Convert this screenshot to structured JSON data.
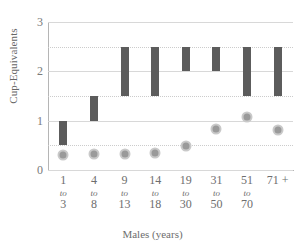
{
  "chart_data": {
    "type": "bar",
    "title": "",
    "subtitle": "",
    "xlabel": "Males (years)",
    "ylabel": "Cup-Equivalents",
    "ylim": [
      0,
      3
    ],
    "yticks": [
      0,
      1,
      2,
      3
    ],
    "minor_gridlines": [
      0.5,
      1.5,
      2.5
    ],
    "grid": true,
    "legend": "none",
    "categories": [
      "1 to 3",
      "4 to 8",
      "9 to 13",
      "14 to 18",
      "19 to 30",
      "31 to 50",
      "51 to 70",
      "71 +"
    ],
    "category_parts": [
      {
        "lo": "1",
        "mid": "to",
        "hi": "3"
      },
      {
        "lo": "4",
        "mid": "to",
        "hi": "8"
      },
      {
        "lo": "9",
        "mid": "to",
        "hi": "13"
      },
      {
        "lo": "14",
        "mid": "to",
        "hi": "18"
      },
      {
        "lo": "19",
        "mid": "to",
        "hi": "30"
      },
      {
        "lo": "31",
        "mid": "to",
        "hi": "50"
      },
      {
        "lo": "51",
        "mid": "to",
        "hi": "70"
      },
      {
        "lo": "71 +",
        "mid": "",
        "hi": ""
      }
    ],
    "series": [
      {
        "name": "Recommended intake range",
        "type": "floating-bar",
        "color": "#5c5c5c",
        "low": [
          0.5,
          1.0,
          1.5,
          1.5,
          2.0,
          2.0,
          1.5,
          1.5
        ],
        "high": [
          1.0,
          1.5,
          2.5,
          2.5,
          2.5,
          2.5,
          2.5,
          2.5
        ]
      },
      {
        "name": "Average intake",
        "type": "marker",
        "color": "#9a9a9a",
        "ring_color": "#c9c9c9",
        "values": [
          0.31,
          0.33,
          0.33,
          0.34,
          0.48,
          0.83,
          1.07,
          0.82
        ]
      }
    ]
  },
  "colors": {
    "background": "#ffffff",
    "bar": "#5c5c5c",
    "marker_fill": "#9a9a9a",
    "marker_ring": "#c9c9c9",
    "gridline_major": "#d8d8d8",
    "gridline_minor": "#cccccc",
    "axis": "#b5b5b5",
    "text": "#6e6e6e"
  }
}
